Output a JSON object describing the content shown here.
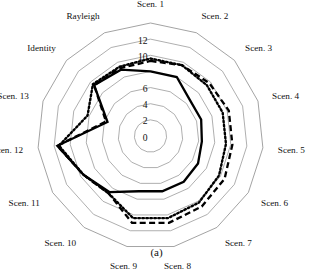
{
  "figure": {
    "caption": "(a)"
  },
  "chart_data": {
    "type": "radar",
    "title": "",
    "xlabel": "",
    "ylabel": "",
    "rlim": [
      0,
      14
    ],
    "rticks": [
      0,
      2,
      4,
      6,
      8,
      10,
      12
    ],
    "rtick_labels": [
      "0",
      "2",
      "4",
      "6",
      "8",
      "10",
      "12"
    ],
    "rtick_labels_visible": [
      "0",
      "2",
      "4",
      "6",
      "10",
      "12"
    ],
    "grid": true,
    "legend": "none",
    "gridline_count": 7,
    "start_angle_deg": -90,
    "direction": "clockwise",
    "categories": [
      "Scen. 1",
      "Scen. 2",
      "Scen. 3",
      "Scen. 4",
      "Scen. 5",
      "Scen. 6",
      "Scen. 7",
      "Scen. 8",
      "Scen. 9",
      "Scen. 10",
      "Scen. 11",
      "Scen. 12",
      "Scen. 13",
      "Identity",
      "Rayleigh"
    ],
    "series": [
      {
        "name": "solid",
        "style": "solid",
        "color": "#000000",
        "values": [
          8.0,
          8.0,
          6.6,
          6.6,
          6.4,
          6.8,
          7.0,
          7.0,
          7.0,
          8.6,
          9.6,
          11.6,
          5.6,
          9.4,
          9.0
        ]
      },
      {
        "name": "dashed",
        "style": "dashed",
        "color": "#000000",
        "values": [
          9.3,
          9.6,
          9.8,
          10.2,
          10.2,
          10.6,
          10.8,
          11.0,
          11.0,
          8.8,
          9.6,
          11.6,
          5.8,
          9.4,
          9.2
        ]
      },
      {
        "name": "dotted",
        "style": "dotted",
        "color": "#000000",
        "values": [
          9.6,
          9.6,
          9.4,
          9.4,
          9.4,
          9.8,
          10.2,
          10.4,
          10.4,
          8.8,
          9.6,
          11.4,
          8.2,
          9.6,
          9.4
        ]
      }
    ]
  }
}
